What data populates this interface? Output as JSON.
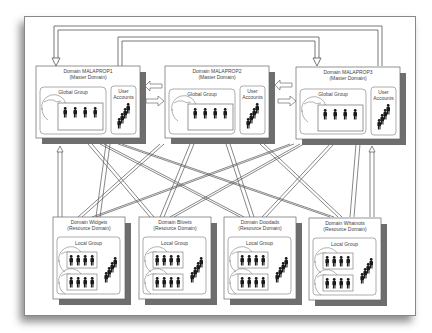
{
  "diagram": {
    "type": "domain-trust-topology",
    "master_domains": [
      {
        "title": "Domain MALAPROP1",
        "subtitle": "(Master Domain)",
        "group_label": "Global Group",
        "accounts_label": "User Accounts"
      },
      {
        "title": "Domain MALAPROP2",
        "subtitle": "(Master Domain)",
        "group_label": "Global Group",
        "accounts_label": "User Accounts"
      },
      {
        "title": "Domain MALAPROP3",
        "subtitle": "(Master Domain)",
        "group_label": "Global Group",
        "accounts_label": "User Accounts"
      }
    ],
    "resource_domains": [
      {
        "title": "Domain Widgets",
        "subtitle": "(Resource Domain)",
        "group_label": "Local Group"
      },
      {
        "title": "Domain Blivets",
        "subtitle": "(Resource Domain)",
        "group_label": "Local Group"
      },
      {
        "title": "Domain Doodads",
        "subtitle": "(Resource Domain)",
        "group_label": "Local Group"
      },
      {
        "title": "Domain Whatnots",
        "subtitle": "(Resource Domain)",
        "group_label": "Local Group"
      }
    ],
    "colors": {
      "box_shadow": "#6e6e6e",
      "line": "#555555",
      "figure": "#1a1a1a",
      "background": "#ffffff"
    }
  }
}
